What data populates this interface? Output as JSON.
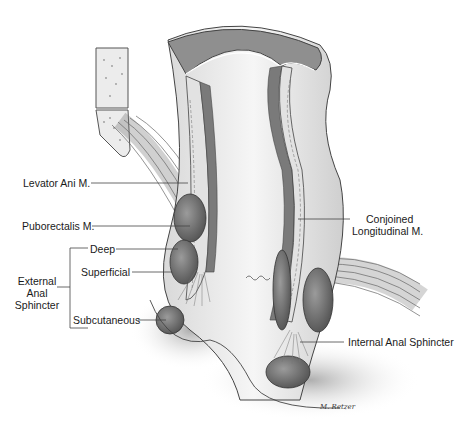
{
  "figure": {
    "type": "anatomical illustration"
  },
  "labels": {
    "levator_ani": "Levator Ani M.",
    "puborectalis": "Puborectalis M.",
    "deep": "Deep",
    "superficial": "Superficial",
    "subcutaneous": "Subcutaneous",
    "external_anal_sphincter": [
      "External",
      "Anal",
      "Sphincter"
    ],
    "conjoined_longitudinal": [
      "Conjoined",
      "Longitudinal M."
    ],
    "internal_anal_sphincter": "Internal Anal Sphincter"
  },
  "signature": "M. Retzer",
  "colors": {
    "background": "#ffffff",
    "line": "#444444",
    "mucosa": "#8a8a8a",
    "muscle_dark": "#6e6e6e",
    "tissue_light": "#e8e8e8"
  }
}
